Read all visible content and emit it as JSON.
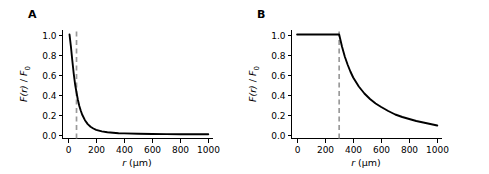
{
  "figure": {
    "panels": [
      {
        "letter": "A",
        "xlabel_var": "r",
        "xlabel_unit": "(µm)",
        "ylabel_num": "F(r)",
        "ylabel_sep": " / ",
        "ylabel_den": "F",
        "ylabel_den_sub": "0",
        "xticks": [
          "0",
          "200",
          "400",
          "600",
          "800",
          "1000"
        ],
        "yticks": [
          "0.0",
          "0.2",
          "0.4",
          "0.6",
          "0.8",
          "1.0"
        ]
      },
      {
        "letter": "B",
        "xlabel_var": "r",
        "xlabel_unit": "(µm)",
        "ylabel_num": "F(r)",
        "ylabel_sep": " / ",
        "ylabel_den": "F",
        "ylabel_den_sub": "0",
        "xticks": [
          "0",
          "200",
          "400",
          "600",
          "800",
          "1000"
        ],
        "yticks": [
          "0.0",
          "0.2",
          "0.4",
          "0.6",
          "0.8",
          "1.0"
        ]
      }
    ]
  },
  "chart_data": [
    {
      "type": "line",
      "panel": "A",
      "title": "",
      "xlabel": "r (µm)",
      "ylabel": "F(r) / F0",
      "xlim": [
        -40,
        1030
      ],
      "ylim": [
        -0.04,
        1.05
      ],
      "xticks": [
        0,
        200,
        400,
        600,
        800,
        1000
      ],
      "yticks": [
        0.0,
        0.2,
        0.4,
        0.6,
        0.8,
        1.0
      ],
      "grid": false,
      "legend": "none",
      "annotations": [
        {
          "type": "vline",
          "x": 60,
          "style": "dashed",
          "color": "#9a9a9a"
        }
      ],
      "series": [
        {
          "name": "F(r)/F0",
          "x": [
            10,
            20,
            30,
            40,
            50,
            60,
            70,
            80,
            90,
            100,
            120,
            140,
            160,
            180,
            200,
            240,
            280,
            320,
            360,
            400,
            500,
            600,
            700,
            800,
            900,
            1000
          ],
          "values": [
            1.0,
            0.88,
            0.74,
            0.61,
            0.5,
            0.42,
            0.345,
            0.285,
            0.24,
            0.2,
            0.143,
            0.104,
            0.078,
            0.06,
            0.047,
            0.031,
            0.022,
            0.017,
            0.013,
            0.011,
            0.007,
            0.005,
            0.004,
            0.003,
            0.002,
            0.002
          ]
        }
      ]
    },
    {
      "type": "line",
      "panel": "B",
      "title": "",
      "xlabel": "r (µm)",
      "ylabel": "F(r) / F0",
      "xlim": [
        -40,
        1030
      ],
      "ylim": [
        -0.04,
        1.05
      ],
      "xticks": [
        0,
        200,
        400,
        600,
        800,
        1000
      ],
      "yticks": [
        0.0,
        0.2,
        0.4,
        0.6,
        0.8,
        1.0
      ],
      "grid": false,
      "legend": "none",
      "annotations": [
        {
          "type": "vline",
          "x": 300,
          "style": "dashed",
          "color": "#9a9a9a"
        }
      ],
      "series": [
        {
          "name": "F(r)/F0",
          "x": [
            0,
            50,
            100,
            150,
            200,
            250,
            300,
            320,
            340,
            360,
            380,
            400,
            440,
            480,
            520,
            560,
            600,
            650,
            700,
            750,
            800,
            850,
            900,
            950,
            1000
          ],
          "values": [
            1.0,
            1.0,
            1.0,
            1.0,
            1.0,
            1.0,
            1.0,
            0.88,
            0.78,
            0.7,
            0.63,
            0.57,
            0.48,
            0.41,
            0.355,
            0.31,
            0.275,
            0.235,
            0.2,
            0.175,
            0.155,
            0.135,
            0.12,
            0.105,
            0.09
          ]
        }
      ]
    }
  ]
}
